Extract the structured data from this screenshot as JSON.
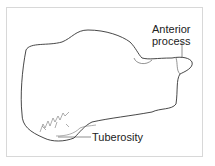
{
  "diagram": {
    "labels": {
      "anterior_line1": "Anterior",
      "anterior_line2": "process",
      "tuberosity": "Tuberosity"
    }
  }
}
